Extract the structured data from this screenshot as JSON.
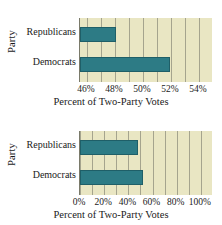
{
  "figure": {
    "bar_color": "#2d7b85",
    "plot_background": "#e9e6c3",
    "gridline_color": "#8e8e7c"
  },
  "chart_data": [
    {
      "type": "bar",
      "orientation": "horizontal",
      "id": "top",
      "title": "",
      "xlabel": "Percent of Two-Party Votes",
      "ylabel": "Party",
      "categories": [
        "Republicans",
        "Democrats"
      ],
      "values": [
        48.1,
        51.9
      ],
      "xlim": [
        45.5,
        55.0
      ],
      "xticks": [
        46,
        48,
        50,
        52,
        54
      ],
      "xticklabels": [
        "46%",
        "48%",
        "50%",
        "52%",
        "54%"
      ],
      "grid": true,
      "legend": "none"
    },
    {
      "type": "bar",
      "orientation": "horizontal",
      "id": "bottom",
      "title": "",
      "xlabel": "Percent of Two-Party Votes",
      "ylabel": "Party",
      "categories": [
        "Republicans",
        "Democrats"
      ],
      "values": [
        48.1,
        51.9
      ],
      "xlim": [
        0,
        110
      ],
      "xticks": [
        0,
        20,
        40,
        60,
        80,
        100
      ],
      "xticklabels": [
        "0%",
        "20%",
        "40%",
        "60%",
        "80%",
        "100%"
      ],
      "grid": true,
      "legend": "none"
    }
  ]
}
